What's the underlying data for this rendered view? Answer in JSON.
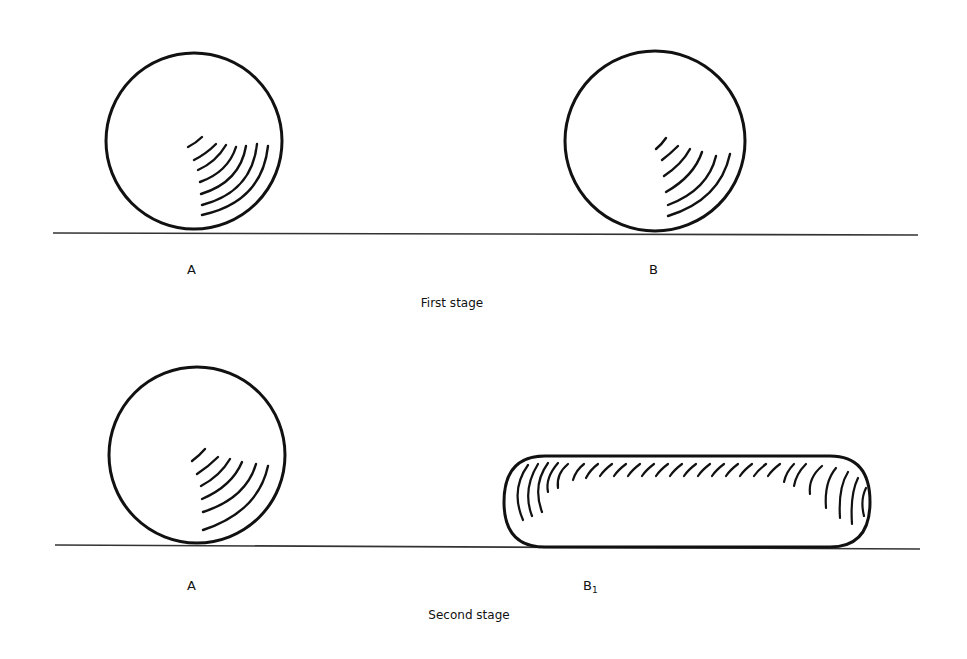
{
  "figure": {
    "stages": [
      {
        "caption": "First stage",
        "objects": [
          {
            "label": "A",
            "shape": "sphere",
            "shading": "quarter-arc hatching lower-right"
          },
          {
            "label": "B",
            "shape": "sphere",
            "shading": "quarter-arc hatching lower-right"
          }
        ]
      },
      {
        "caption": "Second stage",
        "objects": [
          {
            "label": "A",
            "shape": "sphere",
            "shading": "quarter-arc hatching lower-right"
          },
          {
            "label": "B",
            "subscript": "1",
            "shape": "sausage (elongated cylinder)",
            "shading": "top and end hatching"
          }
        ]
      }
    ],
    "colors": {
      "ink": "#111111",
      "background": "#ffffff"
    }
  }
}
